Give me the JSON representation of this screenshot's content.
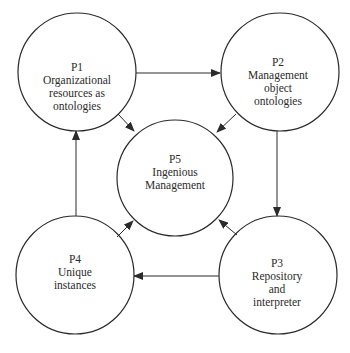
{
  "diagram": {
    "type": "process-cycle",
    "colors": {
      "stroke": "#2b2b2b",
      "fill": "#ffffff",
      "text": "#2b2b2b"
    },
    "nodes": [
      {
        "id": "P1",
        "lines": [
          "P1",
          "Organizational",
          "resources as",
          "ontologies"
        ],
        "cx": 77,
        "cy": 72,
        "r": 59
      },
      {
        "id": "P2",
        "lines": [
          "P2",
          "Management",
          "object",
          "ontologies"
        ],
        "cx": 280,
        "cy": 72,
        "r": 59
      },
      {
        "id": "P3",
        "lines": [
          "P3",
          "Repository",
          "and",
          "interpreter"
        ],
        "cx": 278,
        "cy": 275,
        "r": 59
      },
      {
        "id": "P4",
        "lines": [
          "P4",
          "Unique",
          "instances"
        ],
        "cx": 75,
        "cy": 275,
        "r": 59
      },
      {
        "id": "P5",
        "lines": [
          "P5",
          "Ingenious",
          "Management"
        ],
        "cx": 175,
        "cy": 178,
        "r": 58
      }
    ],
    "edges": [
      {
        "from": "P1",
        "to": "P2"
      },
      {
        "from": "P2",
        "to": "P3"
      },
      {
        "from": "P3",
        "to": "P4"
      },
      {
        "from": "P4",
        "to": "P1"
      },
      {
        "from": "P1",
        "to": "P5"
      },
      {
        "from": "P2",
        "to": "P5"
      },
      {
        "from": "P3",
        "to": "P5"
      },
      {
        "from": "P4",
        "to": "P5"
      }
    ]
  }
}
